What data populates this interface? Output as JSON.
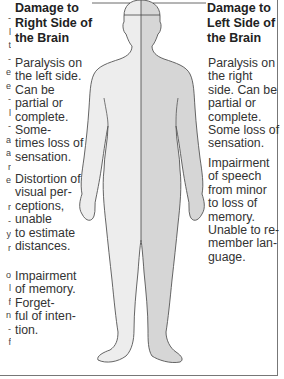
{
  "colors": {
    "body_left_fill": "#ededed",
    "body_right_fill": "#d9d9d9",
    "outline": "#555555",
    "text": "#333333",
    "border": "#777777"
  },
  "left_panel": {
    "heading": "Damage to\nRight Side of\nthe Brain",
    "items": [
      "Paralysis on\nthe left side.\nCan be\npartial or\ncomplete.\nSome-\ntimes loss of\nsensation.",
      "Distortion of\nvisual per-\nceptions,\nunable\nto estimate\ndistances.",
      "Impairment\nof memory.\nForget-\nful of inten-\ntion."
    ]
  },
  "right_panel": {
    "heading": "Damage to\nLeft Side of\nthe Brain",
    "items": [
      "Paralysis on\nthe right\nside. Can be\npartial or\ncomplete.\nSome loss of\nsensation.",
      "Impairment\nof speech\nfrom minor\nto loss of\nmemory.\nUnable to re-\nmember lan-\nguage."
    ]
  },
  "cut_off_column": [
    "-",
    "l",
    "t",
    "-",
    "e",
    "e",
    "-",
    "l",
    "-",
    "a",
    "a",
    "r",
    "e",
    "",
    "r",
    "-",
    "y",
    "r",
    "",
    "o",
    "l",
    "f",
    "n",
    "-",
    "f"
  ]
}
